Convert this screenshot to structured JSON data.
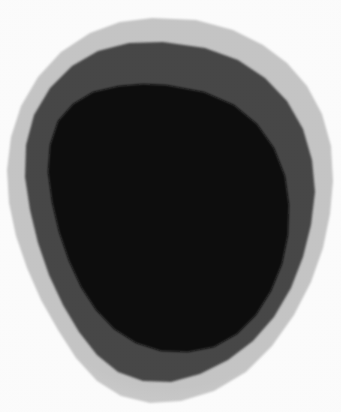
{
  "image": {
    "title": "Faceted concentric ring specimen",
    "description": "A roughly circular, polygon-faceted object composed of three concentric tonal bands on a plain white background.",
    "width": 341,
    "height": 412,
    "background_color": "#fdfdfd",
    "orientation": "portrait",
    "content_type": "natural-image"
  },
  "palette": {
    "background": "#fdfdfd",
    "outer_band": "#c6c6c6",
    "middle_band": "#474747",
    "inner_core": "#0a0a0a",
    "outer_band_edge": "#bdbdbd",
    "middle_band_edge": "#3f3f3f"
  },
  "regions": [
    {
      "name": "outer-ring",
      "label": "Outer light gray ring",
      "color": "#c6c6c6",
      "tone": "light gray",
      "bounds": {
        "x": 7,
        "y": 18,
        "width": 326,
        "height": 386
      }
    },
    {
      "name": "middle-ring",
      "label": "Middle dark gray ring",
      "color": "#474747",
      "tone": "dark gray",
      "bounds": {
        "x": 24,
        "y": 42,
        "width": 292,
        "height": 343
      }
    },
    {
      "name": "inner-core",
      "label": "Inner black core",
      "color": "#0a0a0a",
      "tone": "black",
      "bounds": {
        "x": 48,
        "y": 85,
        "width": 241,
        "height": 267
      }
    }
  ],
  "shapes": {
    "outer_points": "152,18 196,20 233,30 263,45 287,63 307,86 322,114 331,146 333,181 330,214 323,248 311,282 294,315 272,346 246,372 214,391 181,401 150,403 121,396 97,381 76,358 58,330 41,300 27,268 16,236 9,203 7,170 11,137 21,106 38,77 61,52 90,33 120,22",
    "middle_points": "163,42 205,48 238,60 265,78 287,101 303,129 312,160 315,192 311,225 303,257 291,288 274,317 253,341 228,360 200,374 171,382 143,381 118,372 97,355 79,332 63,305 49,275 38,243 30,210 25,177 26,145 34,115 50,88 72,66 98,51 129,43",
    "inner_points": "166,85 204,92 234,105 257,124 274,148 285,176 289,205 288,235 282,264 271,291 256,315 237,334 214,347 188,352 161,351 136,343 114,329 96,310 81,287 69,261 59,232 52,202 48,172 50,145 58,121 73,104 93,92 119,86 143,84"
  },
  "texture": {
    "type": "paper-grain",
    "opacity": 0.22,
    "description": "Fine scanner/paper grain overlaid across the whole frame"
  },
  "a11y": {
    "alt_text": "Three nested, polygon-faceted rings forming a rounded blob: a pale gray outer band, a charcoal middle band, and a solid black center, on a white background."
  }
}
